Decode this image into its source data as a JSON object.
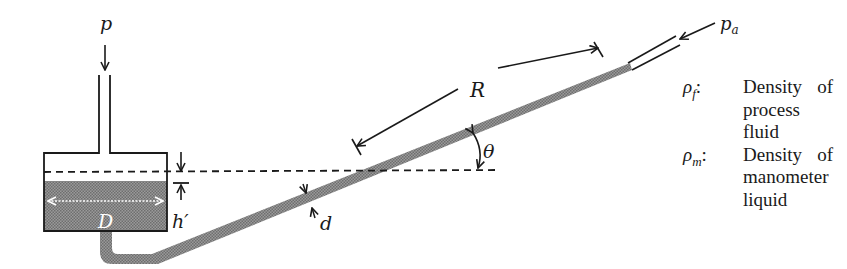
{
  "diagram": {
    "labels": {
      "inlet_pressure": "p",
      "atmospheric_pressure": "p",
      "atmospheric_pressure_sub": "a",
      "reservoir_diameter": "D",
      "level_drop": "h′",
      "reading_length": "R",
      "angle": "θ",
      "tube_diameter": "d"
    },
    "colors": {
      "stroke": "#1a1a1a",
      "liquid_fill": "#8c8c8c",
      "background": "#ffffff",
      "dimension_arrow_in_liquid": "#ffffff"
    }
  },
  "legend": {
    "items": [
      {
        "symbol": "ρ",
        "sub": "f",
        "colon": ":",
        "line1_a": "Density",
        "line1_b": "of",
        "line2": "process fluid"
      },
      {
        "symbol": "ρ",
        "sub": "m",
        "colon": ":",
        "line1_a": "Density",
        "line1_b": "of",
        "line2": "manometer",
        "line3": "liquid"
      }
    ]
  }
}
